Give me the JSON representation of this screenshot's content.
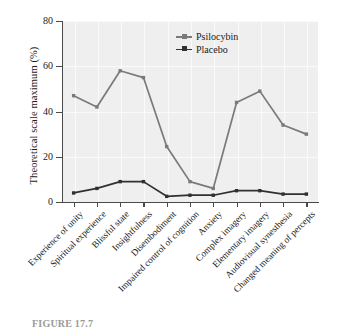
{
  "chart_data": {
    "type": "line",
    "title": "",
    "xlabel": "",
    "ylabel": "Theoretical scale maximum (%)",
    "ylim": [
      0,
      80
    ],
    "yticks": [
      0,
      20,
      40,
      60,
      80
    ],
    "grid": true,
    "legend_position": "top-right",
    "categories": [
      "Experience of unity",
      "Spiritual experience",
      "Blissful state",
      "Insightfulness",
      "Disembodiment",
      "Impaired control of cognition",
      "Anxiety",
      "Complex imagery",
      "Elementary imagery",
      "Audiovisual synesthesia",
      "Changed meaning of percepts"
    ],
    "series": [
      {
        "name": "Psilocybin",
        "color": "#7a7a7a",
        "values": [
          47,
          42,
          58,
          55,
          24.5,
          9,
          6,
          44,
          49,
          34,
          30
        ]
      },
      {
        "name": "Placebo",
        "color": "#303030",
        "values": [
          4,
          6,
          9,
          9,
          2.5,
          3,
          3,
          5,
          5,
          3.5,
          3.5
        ]
      }
    ]
  },
  "legend": {
    "items": [
      {
        "label": "Psilocybin",
        "color": "#7a7a7a"
      },
      {
        "label": "Placebo",
        "color": "#303030"
      }
    ]
  },
  "caption": {
    "text": "FIGURE 17.7"
  },
  "colors": {
    "plot_background": "#efefef",
    "axis": "#4a4a4a",
    "gridline": "#fafafa",
    "psilocybin": "#7a7a7a",
    "placebo": "#303030"
  }
}
